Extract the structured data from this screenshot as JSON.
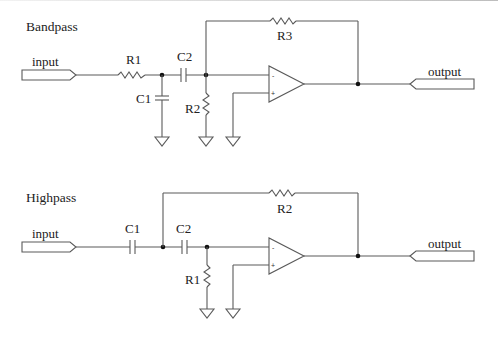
{
  "circuits": [
    {
      "title": "Bandpass",
      "input_label": "input",
      "output_label": "output",
      "components": {
        "r_series": "R1",
        "c_shunt": "C1",
        "c_series": "C2",
        "r_shunt": "R2",
        "r_feedback": "R3"
      },
      "opamp": {
        "minus": "-",
        "plus": "+"
      }
    },
    {
      "title": "Highpass",
      "input_label": "input",
      "output_label": "output",
      "components": {
        "c_series_1": "C1",
        "c_series_2": "C2",
        "r_shunt": "R1",
        "r_feedback": "R2"
      },
      "opamp": {
        "minus": "-",
        "plus": "+"
      }
    }
  ],
  "colors": {
    "wire": "#5a5a5a",
    "node": "#111111",
    "text": "#222222",
    "background": "#ffffff"
  }
}
